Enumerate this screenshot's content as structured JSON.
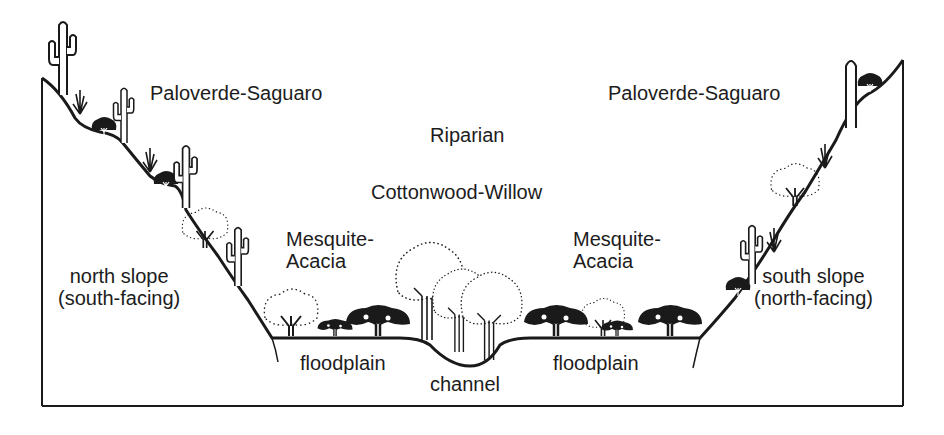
{
  "diagram": {
    "type": "riparian valley cross-section",
    "labels": {
      "left_community": "Paloverde-Saguaro",
      "right_community": "Paloverde-Saguaro",
      "riparian": "Riparian",
      "cottonwood": "Cottonwood-Willow",
      "mesquite_left_1": "Mesquite-",
      "mesquite_left_2": "Acacia",
      "mesquite_right_1": "Mesquite-",
      "mesquite_right_2": "Acacia",
      "north_slope_1": "north slope",
      "north_slope_2": "(south-facing)",
      "south_slope_1": "south slope",
      "south_slope_2": "(north-facing)",
      "floodplain_left": "floodplain",
      "floodplain_right": "floodplain",
      "channel": "channel"
    },
    "colors": {
      "ink": "#1a1a1a",
      "background": "#ffffff"
    },
    "icons": [
      "saguaro-cactus",
      "ocotillo-shrub",
      "paloverde-tree",
      "mesquite-tree",
      "cottonwood-tree",
      "willow-tree"
    ]
  }
}
